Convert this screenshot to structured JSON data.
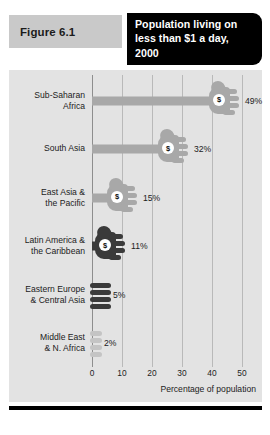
{
  "figure": {
    "tag": "Figure 6.1",
    "title": "Population living on less than $1 a day, 2000",
    "title_lines": [
      "Population living on",
      "less than $1 a day,",
      "2000"
    ]
  },
  "colors": {
    "panel_background": "#e3e3e3",
    "tag_background": "#c9c9c9",
    "title_background": "#000000",
    "title_text": "#ffffff",
    "gridline": "#b9b9b9",
    "axis_line": "#8e8e8e",
    "bar_light": "#a8a8a8",
    "bar_lighter": "#c4c4c4",
    "bar_dark": "#3a3a3a",
    "coin_fill": "#ffffff",
    "text": "#1c1c1c",
    "rule": "#000000"
  },
  "icons": {
    "coin": "$",
    "coin_name": "dollar-coin-icon",
    "bar": "hand-holding-coin-icon"
  },
  "chart_data": {
    "type": "bar",
    "orientation": "horizontal",
    "title": "Population living on less than $1 a day, 2000",
    "xlabel": "Percentage of population",
    "ylabel": "",
    "xlim": [
      0,
      50
    ],
    "xticks": [
      0,
      10,
      20,
      30,
      40,
      50
    ],
    "xtick_labels": [
      "0",
      "10",
      "20",
      "30",
      "40",
      "50"
    ],
    "grid": true,
    "legend": "none",
    "categories": [
      "Sub-Saharan Africa",
      "South Asia",
      "East Asia & the Pacific",
      "Latin America & the Caribbean",
      "Eastern Europe & Central Asia",
      "Middle East & N. Africa"
    ],
    "values": [
      49,
      32,
      15,
      11,
      5,
      2
    ],
    "value_labels": [
      "49%",
      "32%",
      "15%",
      "11%",
      "5%",
      "2%"
    ],
    "points": [
      {
        "category_lines": [
          "Sub-Saharan",
          "Africa"
        ],
        "value": 49,
        "label": "49%",
        "shade": "light"
      },
      {
        "category_lines": [
          "South Asia"
        ],
        "value": 32,
        "label": "32%",
        "shade": "light"
      },
      {
        "category_lines": [
          "East Asia &",
          "the Pacific"
        ],
        "value": 15,
        "label": "15%",
        "shade": "light"
      },
      {
        "category_lines": [
          "Latin America &",
          "the Caribbean"
        ],
        "value": 11,
        "label": "11%",
        "shade": "dark"
      },
      {
        "category_lines": [
          "Eastern Europe",
          "& Central Asia"
        ],
        "value": 5,
        "label": "5%",
        "shade": "dark"
      },
      {
        "category_lines": [
          "Middle East",
          "& N. Africa"
        ],
        "value": 2,
        "label": "2%",
        "shade": "lighter"
      }
    ]
  }
}
